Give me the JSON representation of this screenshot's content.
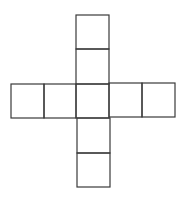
{
  "diagram": {
    "title": "",
    "stroke_color": "#3a3a3a",
    "background_color": "#ffffff",
    "cells": [
      {
        "id": "top-1",
        "x": 76,
        "y": 15,
        "w": 33,
        "h": 34
      },
      {
        "id": "top-2",
        "x": 76,
        "y": 49,
        "w": 33,
        "h": 35
      },
      {
        "id": "left-2",
        "x": 11,
        "y": 84,
        "w": 33,
        "h": 34
      },
      {
        "id": "left-1",
        "x": 44,
        "y": 84,
        "w": 32,
        "h": 34
      },
      {
        "id": "center",
        "x": 76,
        "y": 84,
        "w": 33,
        "h": 34
      },
      {
        "id": "right-1",
        "x": 109,
        "y": 83,
        "w": 33,
        "h": 34
      },
      {
        "id": "right-2",
        "x": 142,
        "y": 83,
        "w": 33,
        "h": 34
      },
      {
        "id": "bottom-1",
        "x": 77,
        "y": 118,
        "w": 33,
        "h": 35
      },
      {
        "id": "bottom-2",
        "x": 77,
        "y": 153,
        "w": 33,
        "h": 34
      }
    ]
  }
}
